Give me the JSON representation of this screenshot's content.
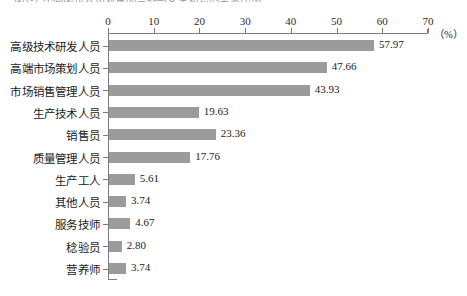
{
  "top_caption": "图1-1 不同岗位人员对食品营养与安全知识的需求比例",
  "chart_data": {
    "type": "bar",
    "orientation": "horizontal",
    "title": "",
    "xlabel": "（%）",
    "ylabel": "",
    "xlim": [
      0,
      70
    ],
    "xticks": [
      0,
      10,
      20,
      30,
      40,
      50,
      60,
      70
    ],
    "xtick_labels": [
      "0",
      "10",
      "20",
      "30",
      "40",
      "50",
      "60",
      "70"
    ],
    "grid": false,
    "legend": false,
    "bar_color": "#9b9b9b",
    "axis_color": "#7c7c7c",
    "categories": [
      "高级技术研发人员",
      "高端市场策划人员",
      "市场销售管理人员",
      "生产技术人员",
      "销售员",
      "质量管理人员",
      "生产工人",
      "其他人员",
      "服务技师",
      "稔验员",
      "营养师"
    ],
    "values": [
      57.97,
      47.66,
      43.93,
      19.63,
      23.36,
      17.76,
      5.61,
      3.74,
      4.67,
      2.8,
      3.74
    ],
    "value_labels": [
      "57.97",
      "47.66",
      "43.93",
      "19.63",
      "23.36",
      "17.76",
      "5.61",
      "3.74",
      "4.67",
      "2.80",
      "3.74"
    ],
    "unit": "（%）"
  }
}
